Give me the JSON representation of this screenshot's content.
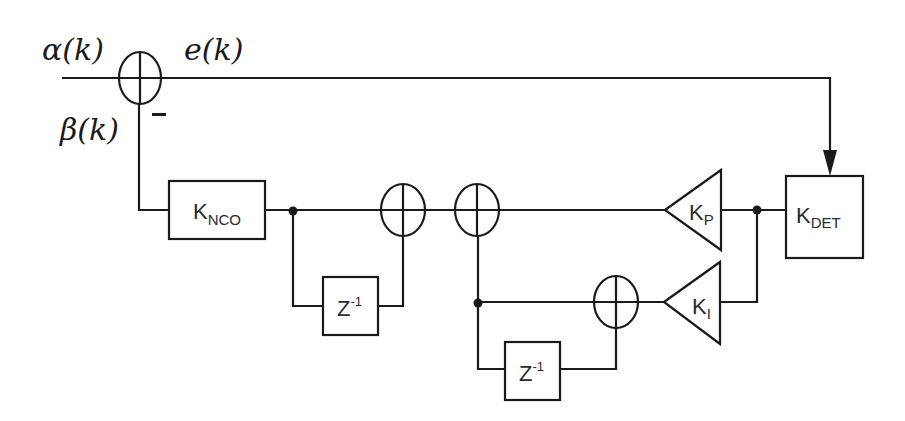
{
  "diagram": {
    "type": "block-diagram",
    "title": "",
    "signals": {
      "input": "α(k)",
      "feedback": "β(k)",
      "error": "e(k)",
      "feedback_sign": "−"
    },
    "blocks": {
      "nco": {
        "label": "K",
        "subscript": "NCO"
      },
      "delay1": {
        "label": "Z",
        "superscript": "-1"
      },
      "delay2": {
        "label": "Z",
        "superscript": "-1"
      },
      "kp": {
        "label": "K",
        "subscript": "P"
      },
      "ki": {
        "label": "K",
        "subscript": "I"
      },
      "det": {
        "label": "K",
        "subscript": "DET"
      }
    },
    "summers": [
      "input-summer",
      "nco-accumulator-summer",
      "pi-output-summer",
      "integrator-summer"
    ],
    "connections": [
      {
        "from": "α(k)",
        "to": "input-summer"
      },
      {
        "from": "input-summer",
        "to": "det",
        "label": "e(k)"
      },
      {
        "from": "det",
        "to": "kp"
      },
      {
        "from": "det",
        "to": "ki"
      },
      {
        "from": "ki",
        "to": "integrator-summer"
      },
      {
        "from": "integrator-summer",
        "to": "delay2"
      },
      {
        "from": "delay2",
        "to": "integrator-summer"
      },
      {
        "from": "integrator-summer",
        "to": "pi-output-summer"
      },
      {
        "from": "kp",
        "to": "pi-output-summer"
      },
      {
        "from": "pi-output-summer",
        "to": "nco-accumulator-summer"
      },
      {
        "from": "nco-accumulator-summer",
        "to": "delay1"
      },
      {
        "from": "delay1",
        "to": "nco-accumulator-summer"
      },
      {
        "from": "nco-accumulator-summer",
        "to": "nco"
      },
      {
        "from": "nco",
        "to": "input-summer",
        "label": "β(k)"
      }
    ]
  }
}
